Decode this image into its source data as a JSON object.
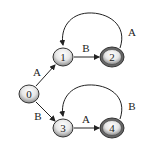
{
  "diagram": {
    "type": "finite-state-automaton",
    "states": [
      {
        "id": "0",
        "label": "0",
        "x": 29,
        "y": 94,
        "accepting": false
      },
      {
        "id": "1",
        "label": "1",
        "x": 63,
        "y": 57,
        "accepting": false
      },
      {
        "id": "2",
        "label": "2",
        "x": 112,
        "y": 57,
        "accepting": true
      },
      {
        "id": "3",
        "label": "3",
        "x": 63,
        "y": 128,
        "accepting": false
      },
      {
        "id": "4",
        "label": "4",
        "x": 112,
        "y": 128,
        "accepting": true
      }
    ],
    "transitions": [
      {
        "from": "0",
        "to": "1",
        "label": "A"
      },
      {
        "from": "0",
        "to": "3",
        "label": "B"
      },
      {
        "from": "1",
        "to": "2",
        "label": "B"
      },
      {
        "from": "2",
        "to": "1",
        "label": "A"
      },
      {
        "from": "3",
        "to": "4",
        "label": "A"
      },
      {
        "from": "4",
        "to": "3",
        "label": "B"
      }
    ]
  }
}
